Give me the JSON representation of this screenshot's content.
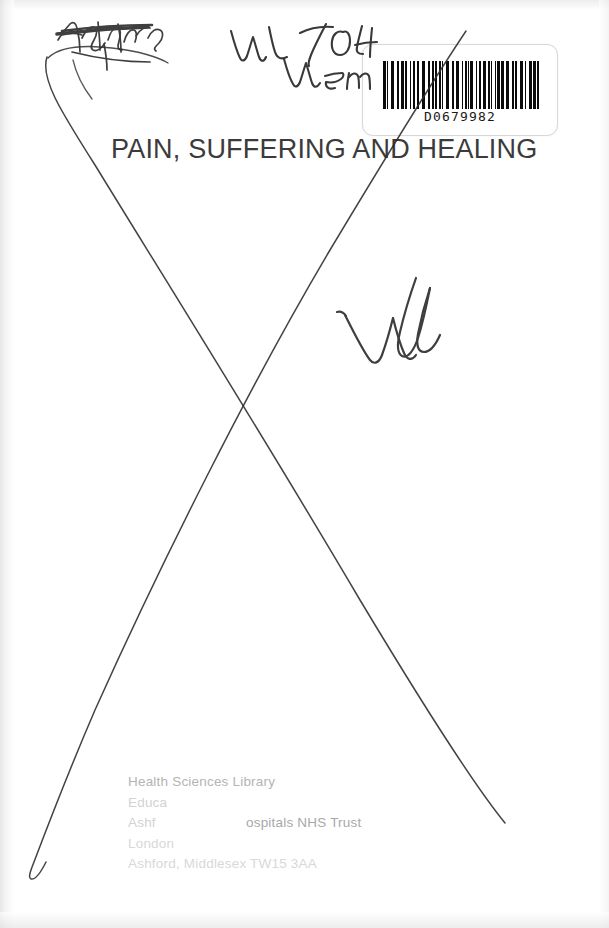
{
  "document": {
    "type": "scanned-book-cover",
    "title": "PAIN, SUFFERING AND HEALING",
    "background_color": "#ffffff",
    "ink_color": "#2c2c2c"
  },
  "barcode": {
    "name": "library-barcode-label",
    "number": "D0679982",
    "symbology_note": "code-39 style vertical bars"
  },
  "handwriting": {
    "shelfmark_line1": "WL 704",
    "shelfmark_line2": "Wem",
    "crossed_out_word": "Ashford",
    "large_mark": "Wd",
    "withdrawal_cross": "X drawn across page"
  },
  "library_stamp": {
    "name": "health-sciences-library-stamp",
    "lines": [
      "Health Sciences Library",
      "Education Centre",
      "Ashford and St Peter's Hospitals NHS Trust",
      "London Road",
      "Ashford, Middlesex  TW15 3AA"
    ],
    "line1": "Health Sciences Library",
    "line2_visible": "Educa",
    "line3_left_visible": "Ashf",
    "line3_right_visible": "ospitals NHS Trust",
    "line3_bold_tail": "Trust",
    "line4_visible": "London",
    "line5_visible": "Ashford, Middlesex  TW15 3AA"
  }
}
